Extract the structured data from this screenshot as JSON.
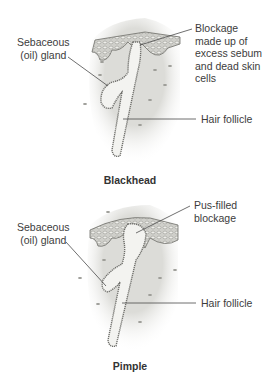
{
  "diagrams": [
    {
      "caption": "Blackhead",
      "labels": {
        "gland": [
          "Sebaceous",
          "(oil) gland"
        ],
        "blockage": [
          "Blockage",
          "made up of",
          "excess sebum",
          "and dead skin",
          "cells"
        ],
        "follicle": "Hair follicle"
      }
    },
    {
      "caption": "Pimple",
      "labels": {
        "gland": [
          "Sebaceous",
          "(oil) gland"
        ],
        "blockage": [
          "Pus-filled",
          "blockage"
        ],
        "follicle": "Hair follicle"
      }
    }
  ],
  "colors": {
    "skin_fill": "#e6e6e3",
    "epidermis": "#bdbdb6",
    "outline": "#6e6e6a",
    "leader_line": "#4a4a4a"
  }
}
